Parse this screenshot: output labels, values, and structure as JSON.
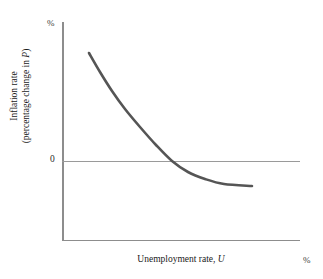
{
  "figure": {
    "title": "",
    "axes": {
      "y_axis": {
        "title_line1": "Inflation rate",
        "title_line2_prefix": "(percentage change in ",
        "title_line2_var": "P",
        "title_line2_suffix": ")",
        "unit_label": "%",
        "zero_label": "0"
      },
      "x_axis": {
        "title_prefix": "Unemployment rate, ",
        "title_var": "U",
        "unit_label": "%"
      }
    },
    "colors": {
      "curve": "#555555",
      "axis": "#8d8d8d",
      "zero_line": "#9a9a9a",
      "background": "#ffffff",
      "text": "#1a1a1a"
    }
  },
  "chart_data": {
    "type": "line",
    "xlabel": "Unemployment rate, U",
    "ylabel": "Inflation rate (percentage change in P)",
    "xunit": "%",
    "yunit": "%",
    "grid": false,
    "legend": null,
    "annotations": [
      {
        "text": "0",
        "axis": "y",
        "value": 0
      },
      {
        "text": "%",
        "axis": "y",
        "position": "top"
      },
      {
        "text": "%",
        "axis": "x",
        "position": "right"
      }
    ],
    "axis_pixel_geometry": {
      "y_axis_x": 62,
      "y_axis_top": 22,
      "x_axis_y": 240,
      "x_axis_right": 300,
      "zero_line_y": 161
    },
    "series": [
      {
        "name": "Phillips curve",
        "color": "#555555",
        "width": 2.6,
        "points_px": [
          [
            89,
            53
          ],
          [
            100,
            72
          ],
          [
            112,
            91
          ],
          [
            125,
            109
          ],
          [
            140,
            127
          ],
          [
            156,
            145
          ],
          [
            172,
            161
          ],
          [
            188,
            172
          ],
          [
            205,
            179
          ],
          [
            224,
            184
          ],
          [
            252,
            186
          ]
        ]
      }
    ]
  }
}
